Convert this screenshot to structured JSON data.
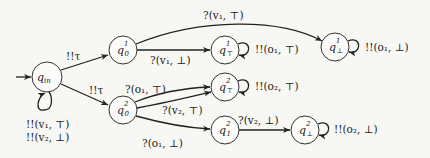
{
  "diagram": {
    "type": "automaton",
    "nodes": [
      {
        "id": "q_in",
        "label": "q",
        "sub": "in",
        "sup": ""
      },
      {
        "id": "q0_1",
        "label": "q",
        "sub": "0",
        "sup": "1"
      },
      {
        "id": "qT_1",
        "label": "q",
        "sub": "⊤",
        "sup": "1"
      },
      {
        "id": "qB_1",
        "label": "q",
        "sub": "⊥",
        "sup": "1"
      },
      {
        "id": "q0_2",
        "label": "q",
        "sub": "0",
        "sup": "2"
      },
      {
        "id": "qT_2",
        "label": "q",
        "sub": "⊤",
        "sup": "2"
      },
      {
        "id": "q1_2",
        "label": "q",
        "sub": "1",
        "sup": "2"
      },
      {
        "id": "qB_2",
        "label": "q",
        "sub": "⊥",
        "sup": "2"
      }
    ],
    "edges": [
      {
        "from": "start",
        "to": "q_in",
        "label": ""
      },
      {
        "from": "q_in",
        "to": "q_in",
        "label_lines": [
          "!!(v₁, ⊤)",
          "!!(v₂, ⊥)"
        ]
      },
      {
        "from": "q_in",
        "to": "q0_1",
        "label": "!!τ"
      },
      {
        "from": "q_in",
        "to": "q0_2",
        "label": "!!τ"
      },
      {
        "from": "q0_1",
        "to": "qT_1",
        "label": "?(v₁, ⊥)"
      },
      {
        "from": "q0_1",
        "to": "qB_1",
        "label": "?(v₁, ⊤)"
      },
      {
        "from": "qT_1",
        "to": "qT_1",
        "label": "!!(o₁, ⊤)"
      },
      {
        "from": "qB_1",
        "to": "qB_1",
        "label": "!!(o₁, ⊥)"
      },
      {
        "from": "q0_2",
        "to": "qT_2",
        "label": "?(o₁, ⊤)"
      },
      {
        "from": "q0_2",
        "to": "qT_2",
        "label": "?(v₂, ⊤)"
      },
      {
        "from": "q0_2",
        "to": "q1_2",
        "label": "?(o₁, ⊥)"
      },
      {
        "from": "qT_2",
        "to": "qT_2",
        "label": "!!(o₂, ⊤)"
      },
      {
        "from": "q1_2",
        "to": "qB_2",
        "label": "?(v₂, ⊥)"
      },
      {
        "from": "qB_2",
        "to": "qB_2",
        "label": "!!(o₂, ⊥)"
      }
    ]
  },
  "labels": {
    "q_in_self_1": "!!(v₁, ⊤)",
    "q_in_self_2": "!!(v₂, ⊥)",
    "tau_upper": "!!τ",
    "tau_lower": "!!τ",
    "q01_to_qT1": "?(v₁, ⊥)",
    "q01_to_qB1": "?(v₁, ⊤)",
    "qT1_self": "!!(o₁, ⊤)",
    "qB1_self": "!!(o₁, ⊥)",
    "q02_o1_top": "?(o₁, ⊤)",
    "q02_v2_top": "?(v₂, ⊤)",
    "q02_o1_bot": "?(o₁, ⊥)",
    "qT2_self": "!!(o₂, ⊤)",
    "q12_to_qB2": "?(v₂, ⊥)",
    "qB2_self": "!!(o₂, ⊥)"
  },
  "nodes": {
    "q_in": {
      "base": "q",
      "sub": "in"
    },
    "q0_1": {
      "base": "q",
      "sub": "0",
      "sup": "1"
    },
    "qT_1": {
      "base": "q",
      "sub": "⊤",
      "sup": "1"
    },
    "qB_1": {
      "base": "q",
      "sub": "⊥",
      "sup": "1"
    },
    "q0_2": {
      "base": "q",
      "sub": "0",
      "sup": "2"
    },
    "qT_2": {
      "base": "q",
      "sub": "⊤",
      "sup": "2"
    },
    "q1_2": {
      "base": "q",
      "sub": "1",
      "sup": "2"
    },
    "qB_2": {
      "base": "q",
      "sub": "⊥",
      "sup": "2"
    }
  }
}
